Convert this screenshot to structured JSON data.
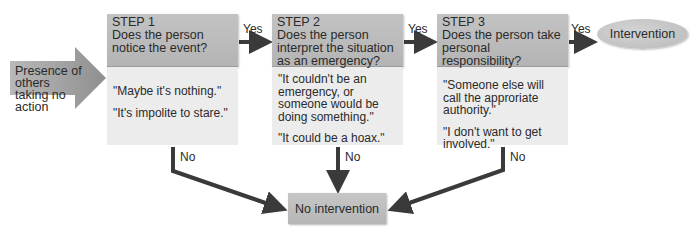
{
  "diagram": {
    "type": "flowchart",
    "start": {
      "label": "Presence of others taking no action"
    },
    "steps": [
      {
        "step_label": "STEP 1",
        "question": "Does the person notice the event?",
        "quotes": [
          "\"Maybe it's nothing.\"",
          "\"It's impolite to stare.\""
        ],
        "yes_label": "Yes",
        "no_label": "No"
      },
      {
        "step_label": "STEP 2",
        "question": "Does the person interpret the situation as an emergency?",
        "quotes": [
          "\"It couldn't be an emergency, or someone would be doing something.\"",
          "\"It could be a hoax.\""
        ],
        "yes_label": "Yes",
        "no_label": "No"
      },
      {
        "step_label": "STEP 3",
        "question": "Does the person take personal responsibility?",
        "quotes": [
          "\"Someone else will call the approriate authority.\"",
          "\"I don't want to get involved.\""
        ],
        "yes_label": "Yes",
        "no_label": "No"
      }
    ],
    "outcome_yes": {
      "label": "Intervention"
    },
    "outcome_no": {
      "label": "No intervention"
    },
    "colors": {
      "box_header": "#bcbcbc",
      "box_body": "#ececec",
      "arrow": "#3a3a3a",
      "start_arrow": "#a8a8a8"
    }
  }
}
